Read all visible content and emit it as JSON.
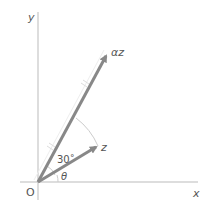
{
  "diagram": {
    "axes": {
      "x_label": "x",
      "y_label": "y",
      "origin_label": "O"
    },
    "vectors": [
      {
        "name": "z",
        "label": "z"
      },
      {
        "name": "alpha-z",
        "label": "αz"
      }
    ],
    "angles": [
      {
        "name": "theta",
        "label": "θ"
      },
      {
        "name": "rotation",
        "label": "30˚"
      }
    ],
    "colors": {
      "axis": "#bbbbbb",
      "vector": "#888888",
      "arc": "#cccccc",
      "tick": "#dddddd"
    }
  }
}
